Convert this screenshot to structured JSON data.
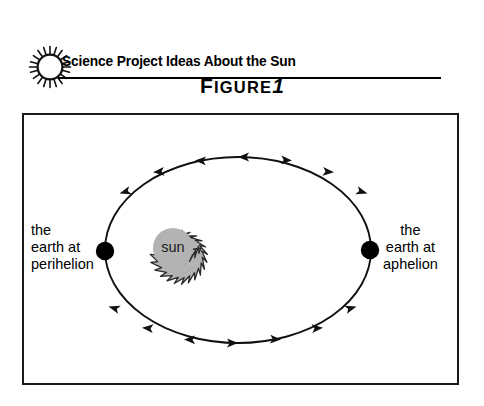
{
  "page": {
    "background_color": "#ffffff",
    "width": 484,
    "height": 406
  },
  "header": {
    "icon": "sun-icon",
    "title": "Science Project Ideas About the Sun",
    "rule_color": "#000000"
  },
  "figure": {
    "caption_lead": "F",
    "caption_rest": "IGURE",
    "caption_number": "1",
    "caption_full": "FIGURE 1",
    "frame_border_color": "#1a1a1a"
  },
  "diagram": {
    "type": "orbit-diagram",
    "orbit": {
      "shape": "ellipse",
      "center_x": 216,
      "center_y": 137,
      "radius_x": 133,
      "radius_y": 93,
      "stroke_color": "#111111",
      "direction": "counterclockwise",
      "arrow_count": 10
    },
    "sun": {
      "label": "sun",
      "fill_color": "#b3b3b3",
      "stroke_color": "#2b2b2b",
      "center_x": 151,
      "center_y": 135,
      "outer_radius": 28,
      "inner_radius": 21,
      "spike_count": 20
    },
    "bodies": [
      {
        "name": "earth-perihelion-dot",
        "color": "#000000",
        "x": 83,
        "y": 138,
        "radius": 9
      },
      {
        "name": "earth-aphelion-dot",
        "color": "#000000",
        "x": 348,
        "y": 137,
        "radius": 9
      }
    ],
    "labels": {
      "perihelion": "the\nearth at\nperihelion",
      "aphelion": "the\nearth at\naphelion"
    }
  }
}
